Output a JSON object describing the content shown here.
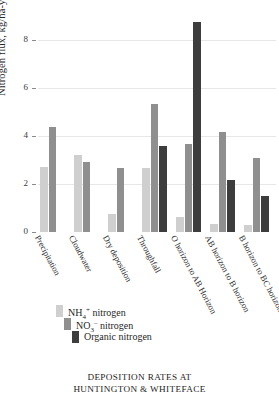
{
  "chart_data": {
    "type": "bar",
    "title": "",
    "xlabel": "",
    "ylabel": "Nitrogen flux, kg/ha-yr",
    "ylim": [
      0,
      9.2
    ],
    "yticks": [
      0,
      2,
      4,
      6,
      8
    ],
    "grid": true,
    "legend_position": "below-axis-left",
    "categories": [
      "Precipitation",
      "Cloudwater",
      "Dry deposition",
      "Throughfall",
      "O horizon to AB Horizon",
      "AB horizon to B horizon",
      "B horizon to BC horizon"
    ],
    "series": [
      {
        "name": "NH4+ nitrogen",
        "color": "#cfcfcf",
        "values": [
          2.72,
          3.22,
          0.75,
          2.65,
          0.62,
          0.35,
          0.3
        ]
      },
      {
        "name": "NO3- nitrogen",
        "color": "#8f8f8f",
        "values": [
          4.38,
          2.9,
          2.68,
          5.32,
          3.65,
          4.15,
          3.08
        ]
      },
      {
        "name": "Organic nitrogen",
        "color": "#3d3d3d",
        "values": [
          0,
          0,
          0,
          3.58,
          8.75,
          2.18,
          1.48
        ]
      }
    ]
  },
  "axis": {
    "tick_labels": [
      "8",
      "6",
      "4",
      "2",
      "0"
    ]
  },
  "legend": {
    "items": [
      {
        "label_html": "NH4+ nitrogen",
        "prefix": "NH",
        "sub": "4",
        "sup": "+",
        "suffix": " nitrogen",
        "color": "#cfcfcf"
      },
      {
        "label_html": "NO3- nitrogen",
        "prefix": "NO",
        "sub": "3",
        "sup": "–",
        "suffix": " nitrogen",
        "color": "#8f8f8f"
      },
      {
        "label_html": "Organic nitrogen",
        "prefix": "Organic nitrogen",
        "sub": "",
        "sup": "",
        "suffix": "",
        "color": "#3d3d3d"
      }
    ]
  },
  "caption": {
    "line1": "DEPOSITION RATES AT",
    "line2": "HUNTINGTON & WHITEFACE"
  },
  "colors": {
    "nh4": "#cfcfcf",
    "no3": "#8f8f8f",
    "organic": "#3d3d3d",
    "grid": "#e8e6e6",
    "text": "#2a2a2a"
  }
}
